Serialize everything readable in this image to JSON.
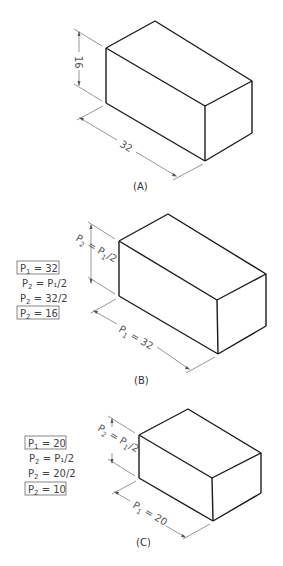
{
  "figures": [
    {
      "id": "A",
      "caption": "(A)",
      "height_label": "16",
      "length_label": "32",
      "equations": []
    },
    {
      "id": "B",
      "caption": "(B)",
      "height_label_main": "P",
      "height_label_sub": "2",
      "height_label_eq": " = P",
      "height_label_sub2": "1",
      "height_label_tail": "/2",
      "length_label_main": "P",
      "length_label_sub": "1",
      "length_label_tail": " = 32",
      "equations": [
        {
          "lhs": "P",
          "lhs_sub": "1",
          "rhs": " = 32",
          "boxed": true
        },
        {
          "lhs": "P",
          "lhs_sub": "2",
          "rhs": " = P₁/2",
          "boxed": false
        },
        {
          "lhs": "P",
          "lhs_sub": "2",
          "rhs": " = 32/2",
          "boxed": false
        },
        {
          "lhs": "P",
          "lhs_sub": "2",
          "rhs": " = 16",
          "boxed": true
        }
      ]
    },
    {
      "id": "C",
      "caption": "(C)",
      "height_label_main": "P",
      "height_label_sub": "2",
      "height_label_eq": " = P",
      "height_label_sub2": "1",
      "height_label_tail": "/2",
      "length_label_main": "P",
      "length_label_sub": "1",
      "length_label_tail": " = 20",
      "equations": [
        {
          "lhs": "P",
          "lhs_sub": "1",
          "rhs": " = 20",
          "boxed": true
        },
        {
          "lhs": "P",
          "lhs_sub": "2",
          "rhs": " = P₁/2",
          "boxed": false
        },
        {
          "lhs": "P",
          "lhs_sub": "2",
          "rhs": " = 20/2",
          "boxed": false
        },
        {
          "lhs": "P",
          "lhs_sub": "2",
          "rhs": " = 10",
          "boxed": true
        }
      ]
    }
  ]
}
